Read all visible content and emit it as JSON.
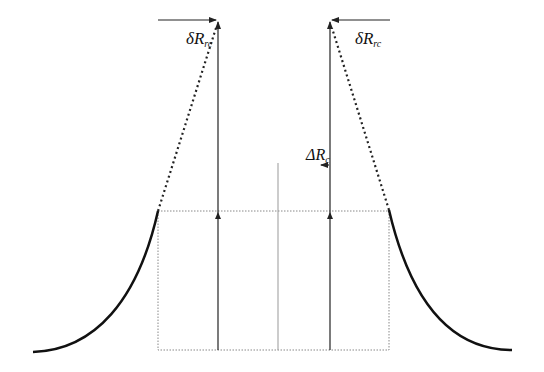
{
  "diagram": {
    "labels": {
      "delta_left": {
        "main": "δR",
        "sub": "rc"
      },
      "delta_right": {
        "main": "δR",
        "sub": "rc"
      },
      "Delta_center": {
        "main": "ΔR",
        "sub": "c"
      }
    },
    "colors": {
      "curve": "#111111",
      "arrow": "#222222",
      "dotted": "#555555",
      "box": "#888888",
      "center_line": "#999999"
    }
  }
}
